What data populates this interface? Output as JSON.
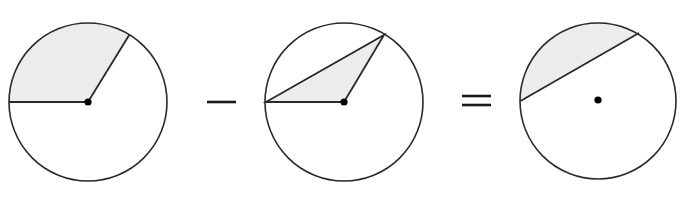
{
  "diagram": {
    "colors": {
      "stroke": "#2a2a2a",
      "shade": "#ececec",
      "background": "#ffffff",
      "dot": "#000000"
    },
    "operators": {
      "minus": "−",
      "equals": "="
    },
    "figures": [
      {
        "name": "sector",
        "center": [
          88,
          102
        ],
        "radius": 79,
        "shaded_region": "sector between horizontal-left radius and upper radius",
        "radius_endpoints": [
          [
            9,
            102
          ],
          [
            129,
            34
          ]
        ]
      },
      {
        "name": "triangle",
        "center": [
          344,
          102
        ],
        "radius": 79,
        "shaded_region": "triangle formed by two radii and chord",
        "vertices": [
          [
            265,
            102
          ],
          [
            384,
            35
          ],
          [
            344,
            102
          ]
        ]
      },
      {
        "name": "segment",
        "center": [
          598,
          101
        ],
        "radius": 78,
        "shaded_region": "circular segment above chord",
        "chord": [
          [
            520,
            101
          ],
          [
            639,
            33
          ]
        ]
      }
    ]
  }
}
